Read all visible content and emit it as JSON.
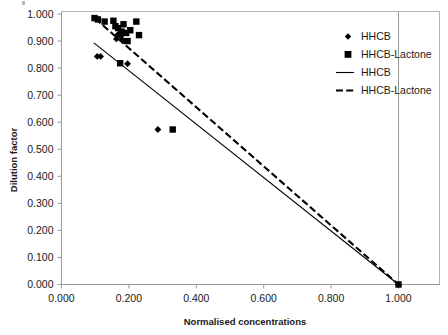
{
  "chart_data": {
    "type": "scatter",
    "title": "",
    "xlabel": "Normalised concentrations",
    "ylabel": "Dilution factor",
    "xlim": [
      0.0,
      1.0
    ],
    "ylim": [
      0.0,
      1.0
    ],
    "grid": false,
    "legend_position": "top-right-outside",
    "x_ticks": [
      "0.000",
      "0.200",
      "0.400",
      "0.600",
      "0.800",
      "1.000"
    ],
    "x_tick_values": [
      0.0,
      0.2,
      0.4,
      0.6,
      0.8,
      1.0
    ],
    "y_ticks": [
      "0.000",
      "0.100",
      "0.200",
      "0.300",
      "0.400",
      "0.500",
      "0.600",
      "0.700",
      "0.800",
      "0.900",
      "1.000"
    ],
    "y_tick_values": [
      0.0,
      0.1,
      0.2,
      0.3,
      0.4,
      0.5,
      0.6,
      0.7,
      0.8,
      0.9,
      1.0
    ],
    "legend": [
      {
        "label": "HHCB",
        "marker": "diamond",
        "kind": "marker"
      },
      {
        "label": "HHCB-Lactone",
        "marker": "square",
        "kind": "marker"
      },
      {
        "label": "HHCB",
        "marker": "solid-line",
        "kind": "line"
      },
      {
        "label": "HHCB-Lactone",
        "marker": "dashed-line",
        "kind": "line"
      }
    ],
    "series": [
      {
        "name": "HHCB",
        "marker": "diamond",
        "points": [
          [
            0.106,
            0.843
          ],
          [
            0.116,
            0.843
          ],
          [
            0.163,
            0.908
          ],
          [
            0.168,
            0.925
          ],
          [
            0.176,
            0.918
          ],
          [
            0.18,
            0.905
          ],
          [
            0.186,
            0.9
          ],
          [
            0.196,
            0.816
          ],
          [
            0.286,
            0.573
          ],
          [
            1.0,
            0.0
          ]
        ]
      },
      {
        "name": "HHCB-Lactone",
        "marker": "square",
        "points": [
          [
            0.098,
            0.985
          ],
          [
            0.108,
            0.98
          ],
          [
            0.128,
            0.972
          ],
          [
            0.154,
            0.975
          ],
          [
            0.16,
            0.955
          ],
          [
            0.168,
            0.948
          ],
          [
            0.178,
            0.935
          ],
          [
            0.184,
            0.962
          ],
          [
            0.192,
            0.93
          ],
          [
            0.196,
            0.9
          ],
          [
            0.204,
            0.94
          ],
          [
            0.222,
            0.972
          ],
          [
            0.23,
            0.922
          ],
          [
            0.174,
            0.818
          ],
          [
            0.33,
            0.573
          ],
          [
            1.0,
            0.0
          ]
        ]
      }
    ],
    "fit_lines": [
      {
        "name": "HHCB",
        "style": "solid",
        "x_start": 0.096,
        "y_start": 0.893,
        "x_end": 1.0,
        "y_end": 0.0
      },
      {
        "name": "HHCB-Lactone",
        "style": "dashed",
        "x_start": 0.1,
        "y_start": 0.983,
        "x_end": 1.0,
        "y_end": 0.0
      }
    ]
  },
  "axes": {
    "y_label": "Dilution factor",
    "x_label": "Normalised concentrations"
  }
}
